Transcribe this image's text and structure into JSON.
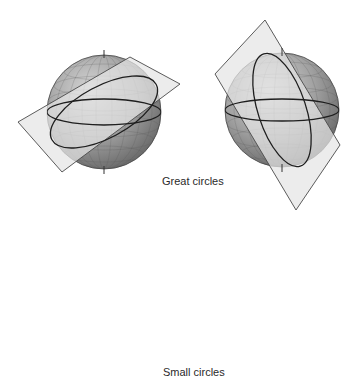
{
  "figure": {
    "panels": [
      {
        "id": "great-circle-1",
        "group": "great",
        "description": "Sphere with plane tilted through center, oblique great circle"
      },
      {
        "id": "great-circle-2",
        "group": "great",
        "description": "Sphere with nearly vertical plane through center, meridian-like great circle"
      },
      {
        "id": "small-circle-1",
        "group": "small",
        "description": "Sphere with plane cutting near the top, small circle near pole"
      },
      {
        "id": "small-circle-2",
        "group": "small",
        "description": "Sphere with plane cutting near the bottom, small circle near south"
      }
    ],
    "labels": {
      "great": "Great circles",
      "small": "Small circles"
    },
    "colors": {
      "sphere_light": "#c8c8c8",
      "sphere_dark": "#6e6e6e",
      "plane": "#e4e4e4",
      "line": "#1e1e1e",
      "background": "#ffffff"
    }
  }
}
